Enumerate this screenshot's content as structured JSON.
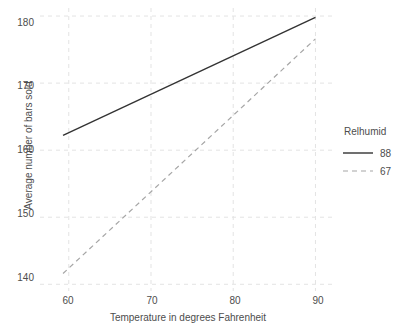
{
  "chart_data": {
    "type": "line",
    "title": "",
    "xlabel": "Temperature in degrees Fahrenheit",
    "ylabel": "Average number of bars sold",
    "xlim": [
      56.5,
      92.5
    ],
    "ylim": [
      139.0,
      181.2
    ],
    "xticks": [
      60,
      70,
      80,
      90
    ],
    "yticks": [
      140,
      150,
      160,
      170,
      180
    ],
    "xtick_labels": [
      "60",
      "70",
      "80",
      "90"
    ],
    "ytick_labels": [
      "140",
      "150",
      "160",
      "170",
      "180"
    ],
    "grid": true,
    "grid_style": "dashed",
    "legend_position": "right",
    "legend_title": "Relhumid",
    "x": [
      59.3,
      90.0
    ],
    "series": [
      {
        "name": "88",
        "label": "88",
        "style": "solid",
        "color": "#333333",
        "values": [
          162.2,
          179.8
        ]
      },
      {
        "name": "67",
        "label": "67",
        "style": "dashed",
        "color": "#a6a6a6",
        "values": [
          141.6,
          176.6
        ]
      }
    ]
  },
  "axes": {
    "y_title": "Average number of bars sold",
    "x_title": "Temperature in degrees Fahrenheit",
    "y_tick_labels": [
      "180",
      "170",
      "160",
      "150",
      "140"
    ],
    "x_tick_labels": [
      "60",
      "70",
      "80",
      "90"
    ]
  },
  "legend": {
    "title": "Relhumid",
    "entries": [
      {
        "label": "88",
        "style": "solid"
      },
      {
        "label": "67",
        "style": "dashed"
      }
    ]
  },
  "colors": {
    "series_solid": "#333333",
    "series_dashed": "#a6a6a6",
    "gridline": "#e3e3e3",
    "text": "#4d4d4d",
    "background": "#ffffff"
  }
}
